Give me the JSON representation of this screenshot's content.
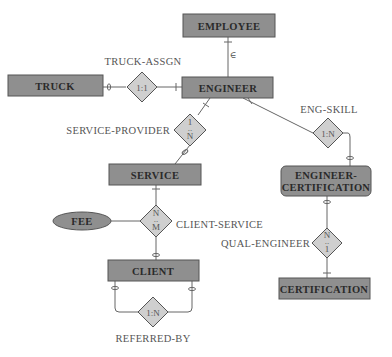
{
  "diagram": {
    "type": "er-diagram",
    "colors": {
      "entity_fill": "#8f8f8f",
      "relationship_fill": "#cfcfcf",
      "stroke": "#555555",
      "text_dark": "#2a2a2a",
      "text_label": "#555555"
    },
    "entities": {
      "employee": "EMPLOYEE",
      "truck": "TRUCK",
      "engineer": "ENGINEER",
      "service": "SERVICE",
      "engineer_certification_line1": "ENGINEER-",
      "engineer_certification_line2": "CERTIFICATION",
      "client": "CLIENT",
      "certification": "CERTIFICATION"
    },
    "attributes": {
      "fee": "FEE"
    },
    "relationships": {
      "truck_assgn": {
        "name": "TRUCK-ASSGN",
        "cardinality": "1:1"
      },
      "service_provider": {
        "name": "SERVICE-PROVIDER",
        "card_top": "1",
        "card_mid": "..",
        "card_bottom": "N"
      },
      "eng_skill": {
        "name": "ENG-SKILL",
        "cardinality": "1:N"
      },
      "client_service": {
        "name": "CLIENT-SERVICE",
        "card_top": "N",
        "card_mid": "..",
        "card_bottom": "M"
      },
      "qual_engineer": {
        "name": "QUAL-ENGINEER",
        "card_top": "N",
        "card_mid": "..",
        "card_bottom": "1"
      },
      "referred_by": {
        "name": "REFERRED-BY",
        "cardinality": "1:N"
      }
    },
    "subtype_symbol": "∈"
  }
}
